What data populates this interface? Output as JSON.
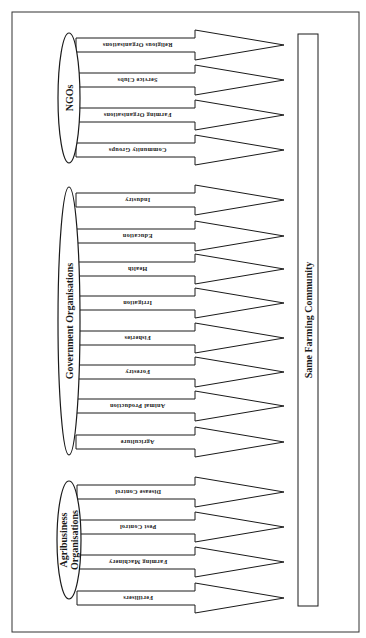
{
  "diagram": {
    "orientation": "rotated-90-clockwise",
    "target": {
      "label": "Same Farming Community"
    },
    "groups": [
      {
        "id": "ngos",
        "label_lines": [
          "NGOs"
        ],
        "ellipse": {
          "cx": 69,
          "cy": 98,
          "rx": 11,
          "ry": 65
        },
        "items": [
          {
            "label": "Religious Organisations",
            "y": 45
          },
          {
            "label": "Service Clubs",
            "y": 80
          },
          {
            "label": "Farming Organisations",
            "y": 115
          },
          {
            "label": "Community Groups",
            "y": 150
          }
        ]
      },
      {
        "id": "government",
        "label_lines": [
          "Government Organisations"
        ],
        "ellipse": {
          "cx": 69,
          "cy": 321,
          "rx": 11,
          "ry": 134
        },
        "items": [
          {
            "label": "Industry",
            "y": 200
          },
          {
            "label": "Education",
            "y": 236
          },
          {
            "label": "Health",
            "y": 269
          },
          {
            "label": "Irrigation",
            "y": 303
          },
          {
            "label": "Fisheries",
            "y": 338
          },
          {
            "label": "Forestry",
            "y": 372
          },
          {
            "label": "Animal Production",
            "y": 406
          },
          {
            "label": "Agriculture",
            "y": 442
          }
        ]
      },
      {
        "id": "agribusiness",
        "label_lines": [
          "Agribusiness",
          "Organisations"
        ],
        "ellipse": {
          "cx": 69,
          "cy": 540,
          "rx": 12,
          "ry": 59
        },
        "items": [
          {
            "label": "Disease Control",
            "y": 492
          },
          {
            "label": "Pest Control",
            "y": 527
          },
          {
            "label": "Farming Machinery",
            "y": 562
          },
          {
            "label": "Fertilisers",
            "y": 598
          }
        ]
      }
    ],
    "colors": {
      "stroke": "#1a1a1a",
      "fill": "#ffffff",
      "frame": "#333333"
    }
  }
}
